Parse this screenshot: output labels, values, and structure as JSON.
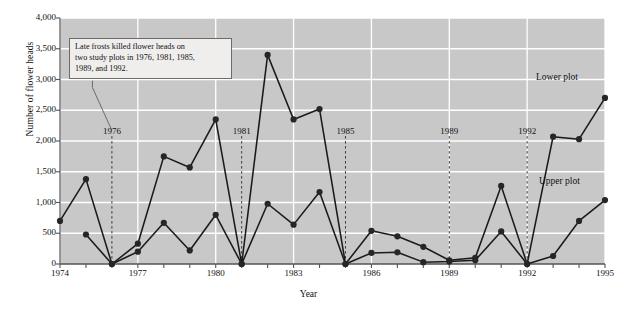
{
  "axes": {
    "ylabel": "Number of flower heads",
    "xlabel": "Year",
    "yticks": [
      "0",
      "500",
      "1,000",
      "1,500",
      "2,000",
      "2,500",
      "3,000",
      "3,500",
      "4,000"
    ],
    "xticks": [
      "1974",
      "1977",
      "1980",
      "1983",
      "1986",
      "1989",
      "1992",
      "1995"
    ]
  },
  "annotation": {
    "line1": "Late frosts killed flower heads on",
    "line2": "two study plots in 1976, 1981, 1985,",
    "line3": "1989, and 1992."
  },
  "frost_labels": [
    {
      "year": "1976"
    },
    {
      "year": "1981"
    },
    {
      "year": "1985"
    },
    {
      "year": "1989"
    },
    {
      "year": "1992"
    }
  ],
  "series_labels": {
    "lower": "Lower plot",
    "upper": "Upper plot"
  },
  "colors": {
    "plot_background": "#c8c8c8",
    "gridline": "#ffffff",
    "series_line": "#1a1a1a",
    "marker": "#262626",
    "annotation_background": "#efeeec",
    "annotation_border": "#6b6b6b",
    "frost_line": "#3a3a3a",
    "axis": "#555555",
    "text": "#111111"
  },
  "chart_data": {
    "type": "line",
    "title": "",
    "xlabel": "Year",
    "ylabel": "Number of flower heads",
    "xlim": [
      1974,
      1995
    ],
    "ylim": [
      0,
      4000
    ],
    "ytick_values": [
      0,
      500,
      1000,
      1500,
      2000,
      2500,
      3000,
      3500,
      4000
    ],
    "xtick_values": [
      1974,
      1977,
      1980,
      1983,
      1986,
      1989,
      1992,
      1995
    ],
    "grid": true,
    "legend": "inline-labels",
    "x": [
      1974,
      1975,
      1976,
      1977,
      1978,
      1979,
      1980,
      1981,
      1982,
      1983,
      1984,
      1985,
      1986,
      1987,
      1988,
      1989,
      1990,
      1991,
      1992,
      1993,
      1994,
      1995
    ],
    "series": [
      {
        "name": "Lower plot",
        "values": [
          700,
          1380,
          0,
          330,
          1750,
          1570,
          2350,
          0,
          3400,
          2350,
          2520,
          0,
          540,
          450,
          280,
          60,
          100,
          1270,
          0,
          2070,
          2030,
          2700
        ]
      },
      {
        "name": "Upper plot",
        "values": [
          null,
          480,
          0,
          200,
          670,
          220,
          800,
          0,
          980,
          640,
          1170,
          0,
          180,
          190,
          30,
          40,
          60,
          530,
          0,
          130,
          700,
          1040
        ]
      }
    ],
    "annotations": [
      {
        "text": "Late frosts killed flower heads on two study plots in 1976, 1981, 1985, 1989, and 1992.",
        "points_to": 1976
      }
    ],
    "frost_years": [
      1976,
      1981,
      1985,
      1989,
      1992
    ]
  }
}
